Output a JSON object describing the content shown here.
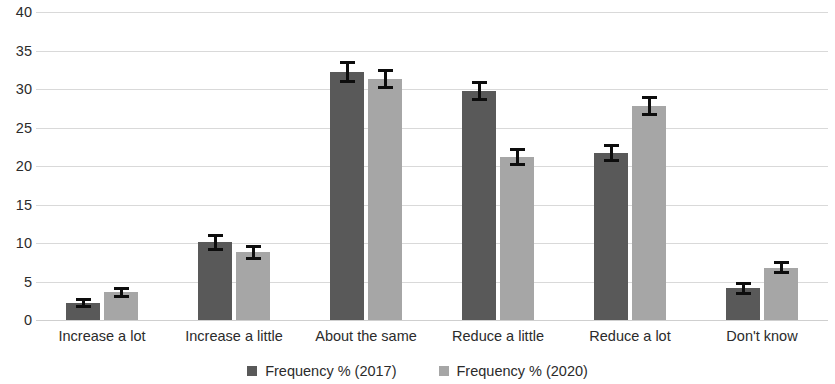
{
  "chart_data": {
    "type": "bar",
    "title": "",
    "subtitle": "",
    "xlabel": "",
    "ylabel": "",
    "ylim": [
      0,
      40
    ],
    "ytick_step": 5,
    "yticks": [
      "40",
      "35",
      "30",
      "25",
      "20",
      "15",
      "10",
      "5",
      "0"
    ],
    "grid": true,
    "legend_position": "bottom",
    "categories": [
      "Increase a lot",
      "Increase a little",
      "About the same",
      "Reduce a little",
      "Reduce a lot",
      "Don't know"
    ],
    "series": [
      {
        "name": "Frequency % (2017)",
        "color": "#595959",
        "values": [
          2.2,
          10.1,
          32.2,
          29.8,
          21.7,
          4.1
        ],
        "errors": [
          0.7,
          1.1,
          1.4,
          1.3,
          1.2,
          0.8
        ]
      },
      {
        "name": "Frequency % (2020)",
        "color": "#a6a6a6",
        "values": [
          3.6,
          8.8,
          31.3,
          21.2,
          27.8,
          6.8
        ],
        "errors": [
          0.7,
          1.0,
          1.3,
          1.2,
          1.3,
          0.8
        ]
      }
    ]
  },
  "legend": {
    "items": [
      {
        "label": "Frequency % (2017)",
        "color": "#595959"
      },
      {
        "label": "Frequency % (2020)",
        "color": "#a6a6a6"
      }
    ]
  },
  "colors": {
    "series_2017": "#595959",
    "series_2020": "#a6a6a6",
    "gridline": "#d9d9d9",
    "error_bar": "#0d0d0d",
    "text": "#2b2b2b",
    "background": "#ffffff"
  }
}
